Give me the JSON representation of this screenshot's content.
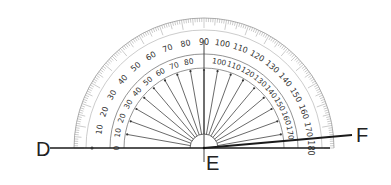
{
  "diagram": {
    "points": {
      "D": "D",
      "E": "E",
      "F": "F"
    },
    "protractor": {
      "center": [
        204,
        148
      ],
      "outer_radius": 130,
      "outer_scale_labels": [
        "10",
        "20",
        "30",
        "40",
        "50",
        "60",
        "70",
        "80",
        "90",
        "100",
        "110",
        "120",
        "130",
        "140",
        "150",
        "160",
        "170",
        "180"
      ],
      "inner_scale_labels": [
        "170",
        "160",
        "150",
        "140",
        "130",
        "120",
        "110",
        "100",
        "80",
        "70",
        "60",
        "50",
        "40",
        "30",
        "20",
        "10",
        "0"
      ],
      "outer_scale_note": "0 at left baseline increasing counterclockwise to 180 at right",
      "inner_scale_note": "180 at left baseline decreasing to 0 at right",
      "left_end_outer_label": "10",
      "left_end_inner_label": "170",
      "left_base_label": "180",
      "right_base_inner_label": "0",
      "right_base_outer_label": "180",
      "top_label": "90"
    },
    "rays": {
      "ED": {
        "direction_deg": 180,
        "label": "D"
      },
      "EF": {
        "direction_deg": 5,
        "label": "F"
      }
    },
    "colors": {
      "line": "#1a1a1a",
      "scale": "#555555",
      "ticks": "#888888"
    }
  }
}
